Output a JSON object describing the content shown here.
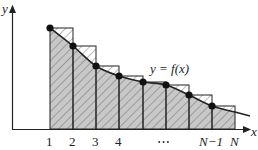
{
  "diagram": {
    "axis": {
      "x_label": "x",
      "y_label": "y"
    },
    "curve_label": "y = f(x)",
    "tick_labels": [
      "1",
      "2",
      "3",
      "4",
      "⋯",
      "N−1",
      "N"
    ],
    "tick_positions_px": [
      50,
      73,
      96,
      119,
      143,
      166,
      189,
      212,
      235
    ],
    "points": [
      {
        "x": 50,
        "y": 28
      },
      {
        "x": 73,
        "y": 46
      },
      {
        "x": 96,
        "y": 66
      },
      {
        "x": 119,
        "y": 76
      },
      {
        "x": 143,
        "y": 82
      },
      {
        "x": 166,
        "y": 85
      },
      {
        "x": 189,
        "y": 95
      },
      {
        "x": 212,
        "y": 106
      }
    ],
    "colors": {
      "area_fill": "#c8c8c8",
      "hatch": "#555555",
      "line": "#222222",
      "background": "#ffffff"
    }
  }
}
